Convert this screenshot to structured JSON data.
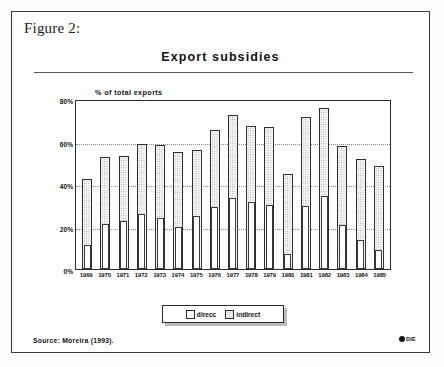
{
  "figure": {
    "caption": "Figure 2:",
    "source": "Source: Moreira (1993).",
    "logo_text": "DIE"
  },
  "chart_data": {
    "type": "bar",
    "title": "Export subsidies",
    "subtitle": "",
    "xlabel": "",
    "ylabel": "% of total exports",
    "ylim": [
      0,
      80
    ],
    "yticks": [
      0,
      20,
      40,
      60,
      80
    ],
    "ytick_labels": [
      "0%",
      "20%",
      "40%",
      "60%",
      "80%"
    ],
    "grid": true,
    "gridlines": [
      20,
      40,
      60
    ],
    "legend_position": "bottom-center",
    "stacked": false,
    "note": "Each year shows a wide outer bar (total/indirect) with a narrow inner bar (direct) drawn in front at the same baseline.",
    "categories": [
      "1969",
      "1970",
      "1971",
      "1972",
      "1973",
      "1974",
      "1975",
      "1976",
      "1977",
      "1978",
      "1979",
      "1980",
      "1981",
      "1982",
      "1983",
      "1984",
      "1985"
    ],
    "series": [
      {
        "name": "indirect",
        "fill": "stippled",
        "values": [
          42.5,
          52.5,
          53.0,
          59.0,
          58.5,
          55.0,
          56.0,
          65.5,
          72.5,
          67.5,
          67.0,
          44.5,
          71.5,
          76.0,
          58.0,
          52.0,
          48.5
        ]
      },
      {
        "name": "direcc",
        "fill": "white",
        "values": [
          11.5,
          21.0,
          22.5,
          26.0,
          24.0,
          20.0,
          25.0,
          29.0,
          33.5,
          31.5,
          30.0,
          7.0,
          29.5,
          34.5,
          20.5,
          13.5,
          9.0
        ]
      }
    ]
  },
  "legend": {
    "items": [
      {
        "label": "direcc",
        "swatch": "white"
      },
      {
        "label": "indirect",
        "swatch": "stippled"
      }
    ]
  }
}
